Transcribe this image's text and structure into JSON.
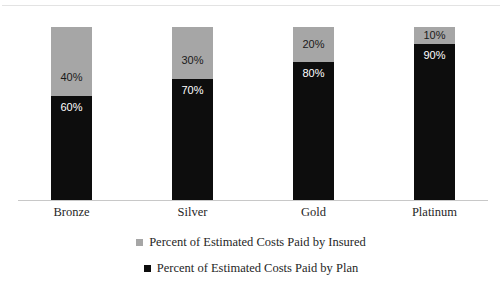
{
  "chart_data": {
    "type": "bar",
    "subtype": "stacked-100-percent",
    "title": "",
    "xlabel": "",
    "ylabel": "",
    "ylim": [
      0,
      100
    ],
    "grid": false,
    "legend_position": "bottom",
    "categories": [
      "Bronze",
      "Silver",
      "Gold",
      "Platinum"
    ],
    "series": [
      {
        "name": "Percent of Estimated Costs Paid by Insured",
        "color": "#a6a6a6",
        "values": [
          40,
          30,
          20,
          10
        ],
        "labels": [
          "40%",
          "30%",
          "20%",
          "10%"
        ]
      },
      {
        "name": "Percent of Estimated Costs Paid by Plan",
        "color": "#0d0d0d",
        "values": [
          60,
          70,
          80,
          90
        ],
        "labels": [
          "60%",
          "70%",
          "80%",
          "90%"
        ]
      }
    ]
  },
  "axis": {
    "baseline_color": "#c8c8c8"
  },
  "legend": {
    "items": [
      {
        "label": "Percent of Estimated Costs Paid by Insured",
        "color": "#a6a6a6"
      },
      {
        "label": "Percent of Estimated Costs Paid by Plan",
        "color": "#0d0d0d"
      }
    ]
  }
}
